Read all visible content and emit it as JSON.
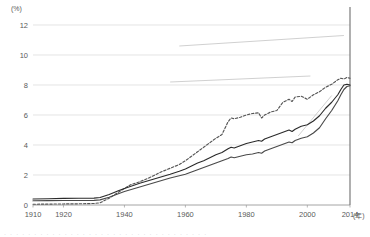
{
  "chart_data": {
    "type": "line",
    "title": "",
    "xlabel": "(年)",
    "ylabel": "(%)",
    "xlim": [
      1910,
      2014
    ],
    "ylim": [
      0,
      12
    ],
    "grid": true,
    "legend": "none",
    "y_ticks": [
      0,
      2,
      4,
      6,
      8,
      10,
      12
    ],
    "y_tick_labels": [
      "0",
      "2",
      "4",
      "6",
      "8",
      "10",
      "12"
    ],
    "x_ticks": [
      1910,
      1920,
      1940,
      1960,
      1980,
      2000,
      2014
    ],
    "x_tick_labels": [
      "1910",
      "1920",
      "1940",
      "1960",
      "1980",
      "2000",
      "2014"
    ],
    "y_axis_unit": "(%)",
    "x_axis_unit": "(年)",
    "series": [
      {
        "name": "series-dashed",
        "style": "dashed",
        "color": "#555555",
        "x": [
          1910,
          1915,
          1920,
          1925,
          1930,
          1932,
          1935,
          1938,
          1940,
          1942,
          1945,
          1948,
          1950,
          1952,
          1955,
          1958,
          1960,
          1962,
          1964,
          1966,
          1968,
          1970,
          1972,
          1974,
          1975,
          1976,
          1978,
          1980,
          1982,
          1984,
          1985,
          1986,
          1988,
          1990,
          1992,
          1994,
          1995,
          1996,
          1998,
          2000,
          2002,
          2004,
          2005,
          2006,
          2008,
          2010,
          2011,
          2012,
          2013,
          2014
        ],
        "values": [
          0.05,
          0.06,
          0.07,
          0.08,
          0.1,
          0.15,
          0.45,
          0.85,
          1.1,
          1.35,
          1.55,
          1.8,
          2.0,
          2.2,
          2.45,
          2.7,
          2.95,
          3.25,
          3.55,
          3.85,
          4.15,
          4.45,
          4.7,
          5.55,
          5.8,
          5.75,
          5.85,
          6.0,
          6.1,
          6.15,
          5.8,
          6.0,
          6.2,
          6.3,
          6.85,
          7.05,
          6.9,
          7.2,
          7.25,
          7.05,
          7.35,
          7.55,
          7.7,
          7.85,
          8.05,
          8.35,
          8.45,
          8.4,
          8.5,
          8.45
        ]
      },
      {
        "name": "series-solid-upper",
        "style": "solid",
        "color": "#2b2b2b",
        "x": [
          1910,
          1915,
          1920,
          1925,
          1930,
          1932,
          1935,
          1938,
          1940,
          1945,
          1950,
          1955,
          1958,
          1960,
          1962,
          1964,
          1966,
          1968,
          1970,
          1972,
          1974,
          1975,
          1976,
          1978,
          1980,
          1982,
          1984,
          1985,
          1986,
          1988,
          1990,
          1992,
          1994,
          1995,
          1996,
          1998,
          2000,
          2002,
          2004,
          2005,
          2006,
          2008,
          2010,
          2011,
          2012,
          2013,
          2014
        ],
        "values": [
          0.4,
          0.42,
          0.44,
          0.45,
          0.46,
          0.5,
          0.7,
          0.95,
          1.1,
          1.45,
          1.75,
          2.05,
          2.25,
          2.4,
          2.6,
          2.8,
          2.95,
          3.15,
          3.35,
          3.5,
          3.75,
          3.85,
          3.8,
          3.95,
          4.1,
          4.2,
          4.3,
          4.25,
          4.4,
          4.55,
          4.7,
          4.85,
          5.0,
          4.9,
          5.05,
          5.25,
          5.35,
          5.6,
          5.95,
          6.2,
          6.45,
          6.85,
          7.35,
          7.7,
          8.0,
          8.05,
          8.0
        ]
      },
      {
        "name": "series-solid-lower",
        "style": "solid",
        "color": "#4a4a4a",
        "x": [
          1910,
          1915,
          1920,
          1925,
          1930,
          1932,
          1935,
          1938,
          1940,
          1945,
          1950,
          1955,
          1958,
          1960,
          1962,
          1964,
          1966,
          1968,
          1970,
          1972,
          1974,
          1975,
          1976,
          1978,
          1980,
          1982,
          1984,
          1985,
          1986,
          1988,
          1990,
          1992,
          1994,
          1995,
          1996,
          1998,
          2000,
          2002,
          2004,
          2005,
          2006,
          2008,
          2010,
          2011,
          2012,
          2013,
          2014
        ],
        "values": [
          0.28,
          0.29,
          0.3,
          0.3,
          0.31,
          0.34,
          0.52,
          0.75,
          0.9,
          1.2,
          1.5,
          1.8,
          1.95,
          2.05,
          2.2,
          2.35,
          2.5,
          2.65,
          2.8,
          2.95,
          3.1,
          3.2,
          3.15,
          3.25,
          3.35,
          3.4,
          3.5,
          3.45,
          3.6,
          3.75,
          3.9,
          4.05,
          4.2,
          4.15,
          4.3,
          4.45,
          4.55,
          4.8,
          5.15,
          5.45,
          5.75,
          6.3,
          6.95,
          7.35,
          7.7,
          7.9,
          7.95
        ]
      }
    ],
    "annotations": [
      {
        "name": "year-2014-marker",
        "type": "vertical-line",
        "x": 2014,
        "y_from": 0,
        "y_to": 13.2
      },
      {
        "name": "leader-line-top",
        "type": "leader",
        "x1": 1958,
        "y1": 10.6,
        "x2": 2012,
        "y2": 11.3
      },
      {
        "name": "leader-line-mid",
        "type": "leader",
        "x1": 1955,
        "y1": 8.2,
        "x2": 2001,
        "y2": 8.6
      },
      {
        "name": "leader-line-low",
        "type": "leader",
        "x1": 2008,
        "y1": 7.3,
        "x2": 1997,
        "y2": 4.6
      }
    ]
  },
  "colors": {
    "grid": "#d9d9d9",
    "axis": "#9a9a9a",
    "text": "#5a5a5a",
    "dashed_series": "#555555",
    "solid_upper": "#2b2b2b",
    "solid_lower": "#4a4a4a",
    "annotation": "#b0b0b0"
  },
  "footnote": {
    "text": "· · · · · · · · · · · · · · · · · · · · · · · · · · · · · · · · · ·"
  }
}
